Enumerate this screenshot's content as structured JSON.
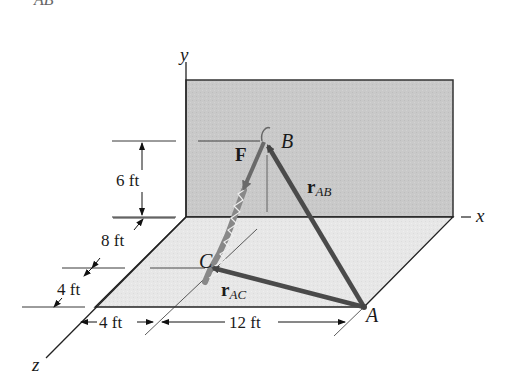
{
  "figure": {
    "top_caption_fragment": "AB",
    "axes": {
      "y": "y",
      "x": "x",
      "z": "z"
    },
    "points": {
      "A": "A",
      "B": "B",
      "C": "C"
    },
    "vectors": {
      "force": "F",
      "r_AB": {
        "main": "r",
        "sub": "AB"
      },
      "r_AC": {
        "main": "r",
        "sub": "AC"
      }
    },
    "dimensions": {
      "height_B": "6 ft",
      "z_8": "8 ft",
      "z_4": "4 ft",
      "x_4": "4 ft",
      "x_12": "12 ft"
    },
    "colors": {
      "wall": "#c8c8c8",
      "floor": "#e6e6e6",
      "vector": "#555555",
      "line": "#222222"
    }
  }
}
